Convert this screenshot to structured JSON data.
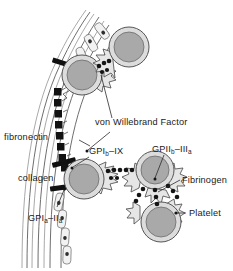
{
  "figure": {
    "background_color": "#ffffff",
    "width": 233,
    "height": 271
  },
  "labels": {
    "fibronectin": "fibronectin",
    "collagen": "collagen",
    "vwf": "von Willebrand Factor",
    "gp1b_ix_main": "GPI",
    "gp1b_ix_sub": "b",
    "gp1b_ix_tail": "–IX",
    "gp2b_3a_main": "GPII",
    "gp2b_3a_sub": "b",
    "gp2b_3a_mid": "–III",
    "gp2b_3a_sub2": "a",
    "gp1a_2a_main": "GPI",
    "gp1a_2a_sub": "a",
    "gp1a_2a_mid": "–II",
    "gp1a_2a_sub2": "a",
    "fibrinogen": "Fibrinogen",
    "platelet": "Platelet"
  },
  "colors": {
    "platelet_outer": "#dcdcdc",
    "platelet_inner": "#a9a9a9",
    "pseudopod": "#e6e6e6",
    "vessel_wall_stroke": "#5d5d5d",
    "endothelium_fill": "#f2f2f2",
    "nucleus": "#2e2e2e",
    "collagen_bar": "#101010",
    "vwf_bead": "#121212",
    "receptor_bead": "#141414",
    "text": "#1a1a1a"
  },
  "structures": {
    "vessel_wall": "curved multilayer arc with endothelial cells",
    "endothelial_cell_count": 8,
    "platelet_count": 4,
    "collagen_bar_count": 3,
    "vwf_bead_count": 8
  }
}
